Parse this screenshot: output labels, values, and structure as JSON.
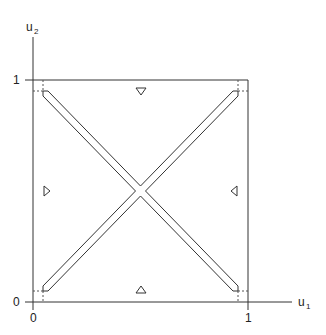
{
  "diagram": {
    "axes": {
      "x_label": "u",
      "x_label_sub": "1",
      "y_label": "u",
      "y_label_sub": "2",
      "x_ticks": [
        {
          "label": "0",
          "value": 0
        },
        {
          "label": "1",
          "value": 1
        }
      ],
      "y_ticks": [
        {
          "label": "0",
          "value": 0
        },
        {
          "label": "1",
          "value": 1
        }
      ]
    },
    "unit_square": {
      "x": [
        0,
        1
      ],
      "y": [
        0,
        1
      ]
    },
    "bands": [
      {
        "name": "main-diagonal-band",
        "from": [
          0.05,
          0.05
        ],
        "to": [
          0.95,
          0.95
        ]
      },
      {
        "name": "anti-diagonal-band",
        "from": [
          0.05,
          0.95
        ],
        "to": [
          0.95,
          0.05
        ]
      }
    ],
    "markers": [
      {
        "name": "top-triangle",
        "direction": "down",
        "position": [
          0.5,
          0.95
        ]
      },
      {
        "name": "bottom-triangle",
        "direction": "up",
        "position": [
          0.5,
          0.05
        ]
      },
      {
        "name": "left-triangle",
        "direction": "right",
        "position": [
          0.05,
          0.5
        ]
      },
      {
        "name": "right-triangle",
        "direction": "left",
        "position": [
          0.95,
          0.5
        ]
      }
    ],
    "colors": {
      "line": "#333333",
      "dotted": "#555555",
      "background": "#ffffff"
    }
  }
}
